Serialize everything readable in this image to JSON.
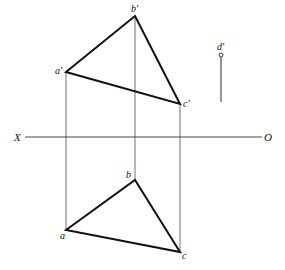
{
  "axis": {
    "left_label": "X",
    "right_label": "O"
  },
  "front_view": {
    "labels": {
      "a": "a'",
      "b": "b'",
      "c": "c'",
      "d": "d'"
    }
  },
  "top_view": {
    "labels": {
      "a": "a",
      "b": "b",
      "c": "c"
    }
  },
  "geometry": {
    "axis_y": 137,
    "axis_x_start": 25,
    "axis_x_end": 262,
    "front": {
      "a": [
        66,
        72
      ],
      "b": [
        135,
        16
      ],
      "c": [
        180,
        104
      ],
      "d": [
        221,
        55
      ],
      "d_line_end": [
        221,
        102
      ]
    },
    "top": {
      "a": [
        66,
        230
      ],
      "b": [
        135,
        180
      ],
      "c": [
        180,
        252
      ]
    }
  },
  "colors": {
    "stroke": "#111111",
    "thin": "#333333"
  }
}
